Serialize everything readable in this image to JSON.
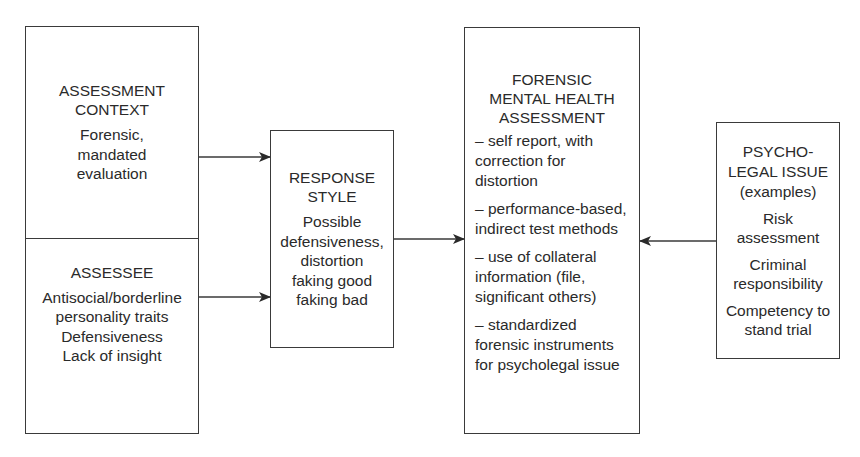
{
  "diagram": {
    "left_box": {
      "context": {
        "title_lines": [
          "ASSESSMENT",
          "CONTEXT"
        ],
        "body_lines": [
          "Forensic,",
          "mandated",
          "evaluation"
        ]
      },
      "assessee": {
        "title_lines": [
          "ASSESSEE"
        ],
        "body_lines": [
          "Antisocial/borderline",
          "personality traits",
          "Defensiveness",
          "Lack of insight"
        ]
      }
    },
    "response_style": {
      "title_lines": [
        "RESPONSE",
        "STYLE"
      ],
      "body_lines": [
        "Possible",
        "defensiveness,",
        "distortion",
        "faking good",
        "faking bad"
      ]
    },
    "fmha": {
      "title_lines": [
        "FORENSIC",
        "MENTAL HEALTH",
        "ASSESSMENT"
      ],
      "items": [
        [
          "– self report, with",
          "correction for",
          "distortion"
        ],
        [
          "– performance-based,",
          "indirect test methods"
        ],
        [
          "– use of collateral",
          "information (file,",
          "significant others)"
        ],
        [
          "– standardized",
          "forensic instruments",
          "for psycholegal issue"
        ]
      ]
    },
    "psycholegal": {
      "title_lines": [
        "PSYCHO-",
        "LEGAL ISSUE",
        "(examples)"
      ],
      "examples": [
        [
          "Risk",
          "assessment"
        ],
        [
          "Criminal",
          "responsibility"
        ],
        [
          "Competency to",
          "stand trial"
        ]
      ]
    },
    "arrows": [
      {
        "from": "assessment-context",
        "to": "response-style"
      },
      {
        "from": "assessee",
        "to": "response-style"
      },
      {
        "from": "response-style",
        "to": "fmha"
      },
      {
        "from": "psycholegal-issue",
        "to": "fmha"
      }
    ],
    "colors": {
      "stroke": "#3a3a3a",
      "text": "#2a2a2a",
      "background": "#ffffff"
    }
  }
}
